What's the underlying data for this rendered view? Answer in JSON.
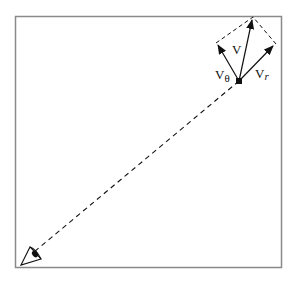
{
  "diagram": {
    "labels": {
      "v_main": "V",
      "v_theta_base": "V",
      "v_theta_sub": "θ",
      "v_r_base": "V",
      "v_r_sub": "r"
    },
    "colors": {
      "frame": "#8a8a8a",
      "ink": "#111111",
      "background": "#ffffff"
    },
    "elements": {
      "frame": "rectangular border",
      "point": "moving object (filled dot)",
      "observer": "eye icon at lower-left",
      "line_of_sight": "dashed line from observer to object",
      "v_arrow": "total velocity vector",
      "v_theta_arrow": "tangential velocity component",
      "v_r_arrow": "radial velocity component",
      "parallelogram": "dashed construction lines completing the vector sum"
    }
  }
}
